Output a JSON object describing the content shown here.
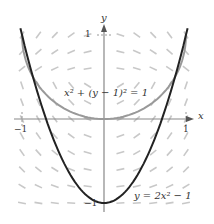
{
  "chart_data": {
    "type": "line",
    "title": "",
    "xlabel": "x",
    "ylabel": "y",
    "xlim": [
      -1.1,
      1.1
    ],
    "ylim": [
      -1.05,
      1.1
    ],
    "x_ticks": [
      "-1",
      "1"
    ],
    "y_ticks": [
      "1",
      "-1"
    ],
    "grid": false,
    "slope_field": true,
    "series": [
      {
        "name": "x^2 + (y-1)^2 = 1",
        "color": "#999999",
        "equation": "x^2 + (y - 1)^2 = 1",
        "kind": "lower semicircle centered (0,1) radius 1"
      },
      {
        "name": "y = 2x^2 - 1",
        "color": "#222222",
        "equation": "y = 2x^2 - 1",
        "x": [
          -1,
          -0.5,
          0,
          0.5,
          1
        ],
        "values": [
          1,
          -0.5,
          -1,
          -0.5,
          1
        ]
      }
    ],
    "annotations": [
      "x² + (y − 1)² = 1",
      "y = 2x² − 1"
    ]
  },
  "labels": {
    "x_axis": "x",
    "y_axis": "y",
    "tick_x_neg": "−1",
    "tick_x_pos": "1",
    "tick_y_pos": "1",
    "tick_y_neg": "−1",
    "circle_eq": "x² + (y − 1)² = 1",
    "parabola_eq": "y = 2x² − 1"
  }
}
